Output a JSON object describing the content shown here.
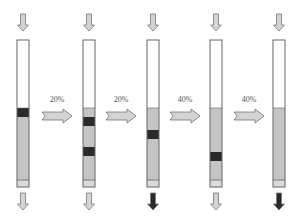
{
  "diagram": {
    "type": "column-gradient-elution-sequence",
    "colors": {
      "column_outline": "#666666",
      "column_empty": "#ffffff",
      "column_gel": "#c4c4c4",
      "band": "#2a2a2a",
      "bottom_frit": "#dcdcdc",
      "arrow_fill_light": "#d4d4d4",
      "arrow_fill_dark": "#2a2a2a",
      "arrow_stroke": "#777777"
    },
    "columns": [
      {
        "id": "col-1",
        "x": 17,
        "bands": [
          {
            "top": 108,
            "height": 9
          }
        ],
        "outflow": "light"
      },
      {
        "id": "col-2",
        "x": 83,
        "bands": [
          {
            "top": 117,
            "height": 9
          },
          {
            "top": 147,
            "height": 9
          }
        ],
        "outflow": "light"
      },
      {
        "id": "col-3",
        "x": 147,
        "bands": [
          {
            "top": 130,
            "height": 9
          }
        ],
        "outflow": "dark"
      },
      {
        "id": "col-4",
        "x": 210,
        "bands": [
          {
            "top": 152,
            "height": 9
          }
        ],
        "outflow": "light"
      },
      {
        "id": "col-5",
        "x": 273,
        "bands": [],
        "outflow": "dark"
      }
    ],
    "transitions": [
      {
        "label": "20%",
        "x": 42
      },
      {
        "label": "20%",
        "x": 106
      },
      {
        "label": "40%",
        "x": 170
      },
      {
        "label": "40%",
        "x": 234
      }
    ]
  }
}
